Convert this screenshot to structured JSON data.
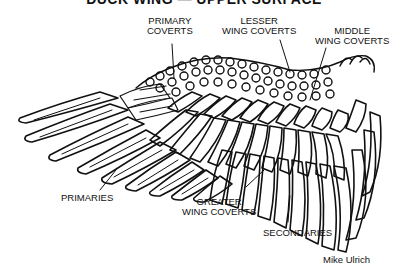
{
  "title": "DUCK WING — UPPER SURFACE",
  "labels": {
    "primary_coverts": {
      "line1": "PRIMARY",
      "line2": "COVERTS"
    },
    "lesser_wing_coverts": {
      "line1": "LESSER",
      "line2": "WING COVERTS"
    },
    "middle_wing_coverts": {
      "line1": "MIDDLE",
      "line2": "WING COVERTS"
    },
    "primaries": {
      "line1": "PRIMARIES"
    },
    "greater_wing_coverts": {
      "line1": "GREATER",
      "line2": "WING COVERTS"
    },
    "secondaries": {
      "line1": "SECONDARIES"
    }
  },
  "credit": "Mike Ulrich",
  "colors": {
    "ink": "#111111",
    "background": "#ffffff"
  }
}
